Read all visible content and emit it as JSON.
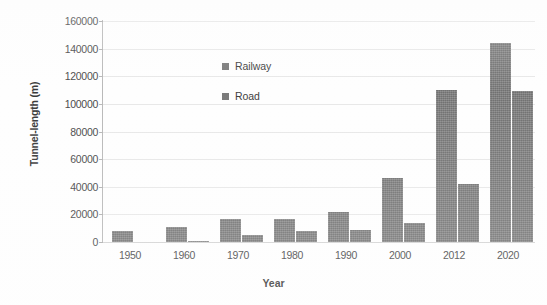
{
  "chart_data": {
    "type": "bar",
    "title": "",
    "xlabel": "Year",
    "ylabel": "Tunnel-length (m)",
    "categories": [
      "1950",
      "1960",
      "1970",
      "1980",
      "1990",
      "2000",
      "2012",
      "2020"
    ],
    "series": [
      {
        "name": "Railway",
        "color": "#7b7b7b",
        "values": [
          8000,
          11000,
          17000,
          17000,
          22000,
          46000,
          110000,
          144000
        ]
      },
      {
        "name": "Road",
        "color": "#7b7b7b",
        "values": [
          0,
          500,
          5000,
          8000,
          9000,
          14000,
          42000,
          109000
        ]
      }
    ],
    "ylim": [
      0,
      160000
    ],
    "yticks": [
      0,
      20000,
      40000,
      60000,
      80000,
      100000,
      120000,
      140000,
      160000
    ],
    "ytick_labels": [
      "0",
      "20000",
      "40000",
      "60000",
      "80000",
      "100000",
      "120000",
      "140000",
      "160000"
    ],
    "grid": true,
    "grid_axis": "y",
    "legend_position": "inside-upper-left",
    "legend": [
      "Railway",
      "Road"
    ]
  },
  "axes": {
    "y_title": "Tunnel-length (m)",
    "x_title": "Year"
  },
  "legend": {
    "entries": [
      {
        "label": "Railway",
        "swatch": "legend-swatch-railway"
      },
      {
        "label": "Road",
        "swatch": "legend-swatch-road"
      }
    ]
  },
  "colors": {
    "bar": "#7b7b7b",
    "gridline": "#e8e8e8",
    "axis": "#b9b9b9",
    "text": "#3d3d3d",
    "background": "#ffffff"
  }
}
